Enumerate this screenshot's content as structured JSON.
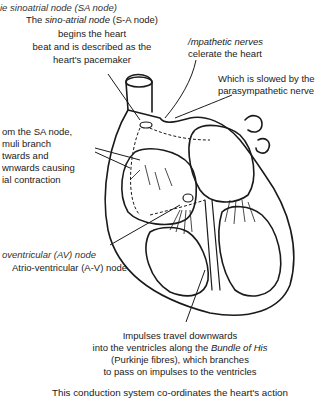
{
  "labels": {
    "sa_node_cut": "ie sinoatrial node (SA node)",
    "sa_node_line1_pre": "The ",
    "sa_node_line1_em": "sino-atrial node",
    "sa_node_line1_post": " (S-A node)",
    "sa_node_line2": "begins the heart",
    "sa_node_line3": "beat and is described as the",
    "sa_node_line4": "heart's pacemaker",
    "sympathetic_line1": "/mpathetic nerves",
    "sympathetic_line2": "celerate the heart",
    "parasympathetic_line1": "Which is slowed by the",
    "parasympathetic_line2": "parasympathetic nerve",
    "atrial_line1": "om the SA node,",
    "atrial_line2": "muli branch",
    "atrial_line3": "twards and",
    "atrial_line4": "wnwards causing",
    "atrial_line5": "ial contraction",
    "av_node_cut": "oventricular (AV) node",
    "av_node": "Atrio-ventricular (A-V) node",
    "bundle_line1": "Impulses travel downwards",
    "bundle_line2_pre": "into the ventricles along the ",
    "bundle_line2_em": "Bundle of His",
    "bundle_line3": "(Purkinje fibres), which branches",
    "bundle_line4": "to pass on impulses to the ventricles",
    "caption": "This conduction system co-ordinates the heart's action"
  },
  "colors": {
    "ink": "#1a1a1a",
    "paper": "#ffffff",
    "muted": "#555555"
  }
}
